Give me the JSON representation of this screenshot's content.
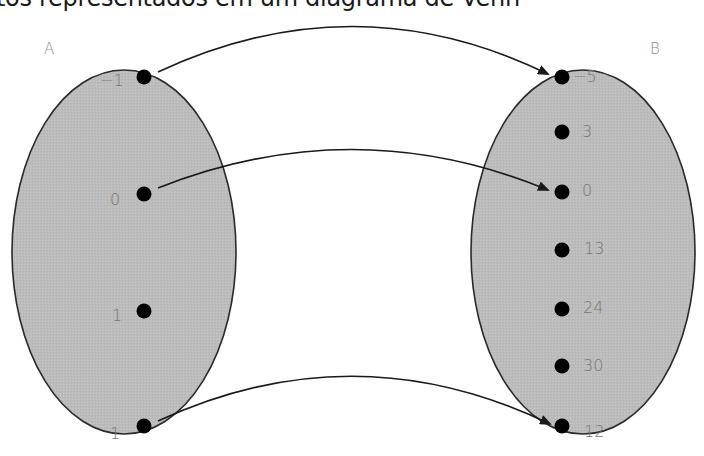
{
  "title": "tos representados em um diagrama de Venn",
  "sets": {
    "A": {
      "label": "A",
      "fill": "#bdbdbd",
      "elements": [
        "−1",
        "0",
        "1",
        "1"
      ]
    },
    "B": {
      "label": "B",
      "fill": "#bdbdbd",
      "elements": [
        "−5",
        "3",
        "0",
        "13",
        "24",
        "30",
        "12"
      ]
    }
  },
  "mappings": [
    {
      "from": "−1",
      "to": "−5"
    },
    {
      "from": "0",
      "to": "0"
    },
    {
      "from": "1",
      "to": "12"
    }
  ],
  "colors": {
    "ellipse_fill": "#bdbdbd",
    "ellipse_stroke": "#2a2a2a",
    "dot": "#000000",
    "arrow": "#1a1a1a",
    "label_text": "#777777"
  }
}
